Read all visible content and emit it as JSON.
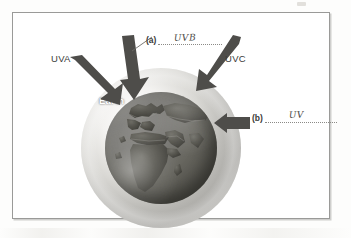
{
  "figure": {
    "caption_labels": {
      "uva": "UVA",
      "uvc": "UVC",
      "earth": "Earth"
    },
    "blanks": [
      {
        "tag": "(a)",
        "answer": "UVB",
        "handwritten": true,
        "points_to": "middle downward arrow reaching the atmosphere"
      },
      {
        "tag": "(b)",
        "answer": "UV",
        "handwritten": true,
        "points_to": "horizontal arrow at the right side of the globe"
      }
    ],
    "arrows": [
      {
        "name": "uva-arrow",
        "direction": "down-right"
      },
      {
        "name": "uvb-arrow",
        "direction": "down"
      },
      {
        "name": "uvc-arrow",
        "direction": "down-left"
      },
      {
        "name": "uv-arrow",
        "direction": "left"
      }
    ],
    "colors": {
      "frame_border": "#9a9a98",
      "arrow_fill": "#4e4d4a",
      "atmosphere": "#d9d8d4",
      "earth": "#67665f",
      "text": "#3b3b39",
      "handwriting": "#4a4a46"
    }
  }
}
